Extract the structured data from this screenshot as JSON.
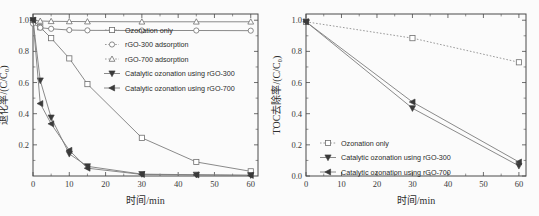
{
  "figure": {
    "panels": [
      "left",
      "right"
    ],
    "background": "#fbfbfb",
    "line_color": "#7d7d7d",
    "marker_fill_color": "#3a3a3a",
    "marker_open_color": "#ffffff"
  },
  "chart_data": [
    {
      "type": "line",
      "panel": "left",
      "title": "",
      "xlabel": "时间/min",
      "ylabel": "退化率/(C/C₀)",
      "xlim": [
        0,
        62
      ],
      "ylim": [
        0,
        1.04
      ],
      "xticks": [
        0,
        10,
        20,
        30,
        40,
        50,
        60
      ],
      "yticks": [
        0.2,
        0.4,
        0.6,
        0.8,
        1.0
      ],
      "grid": false,
      "legend_position": "upper-center",
      "series": [
        {
          "name": "Ozonation only",
          "marker": "open-square",
          "linestyle": "solid",
          "x": [
            0,
            2,
            5,
            10,
            15,
            30,
            45,
            60
          ],
          "values": [
            1.0,
            0.955,
            0.885,
            0.755,
            0.59,
            0.245,
            0.09,
            0.03
          ]
        },
        {
          "name": "rGO-300 adsorption",
          "marker": "open-circle",
          "linestyle": "solid",
          "x": [
            0,
            2,
            5,
            10,
            15,
            30,
            45,
            60
          ],
          "values": [
            0.978,
            0.952,
            0.945,
            0.937,
            0.935,
            0.934,
            0.934,
            0.933
          ]
        },
        {
          "name": "rGO-700 adsorption",
          "marker": "open-triangle-up",
          "linestyle": "solid",
          "x": [
            0,
            2,
            5,
            10,
            15,
            30,
            45,
            60
          ],
          "values": [
            1.0,
            0.995,
            0.993,
            0.992,
            0.991,
            0.99,
            0.99,
            0.99
          ]
        },
        {
          "name": "Catalytic ozonation using rGO-300",
          "marker": "filled-triangle-down",
          "linestyle": "solid",
          "x": [
            0,
            2,
            5,
            10,
            15,
            30,
            45,
            60
          ],
          "values": [
            1.0,
            0.613,
            0.375,
            0.142,
            0.062,
            0.012,
            0.008,
            0.005
          ]
        },
        {
          "name": "Catalytic ozonation using rGO-700",
          "marker": "filled-triangle-left",
          "linestyle": "solid",
          "x": [
            0,
            2,
            5,
            10,
            15,
            30,
            45,
            60
          ],
          "values": [
            1.0,
            0.465,
            0.335,
            0.165,
            0.05,
            0.01,
            0.007,
            0.004
          ]
        }
      ]
    },
    {
      "type": "line",
      "panel": "right",
      "title": "",
      "xlabel": "时间/min",
      "ylabel": "TOC去除率/(C/C₀)",
      "xlim": [
        0,
        62
      ],
      "ylim": [
        0,
        1.04
      ],
      "xticks": [
        0,
        10,
        20,
        30,
        40,
        50,
        60
      ],
      "yticks": [
        0.0,
        0.2,
        0.4,
        0.6,
        0.8,
        1.0
      ],
      "grid": false,
      "legend_position": "lower-left",
      "series": [
        {
          "name": "Ozonation only",
          "marker": "open-square",
          "linestyle": "dotted",
          "x": [
            0,
            30,
            60
          ],
          "values": [
            0.99,
            0.885,
            0.73
          ]
        },
        {
          "name": "Catalytic ozonation using rGO-300",
          "marker": "filled-triangle-down",
          "linestyle": "solid",
          "x": [
            0,
            30,
            60
          ],
          "values": [
            0.99,
            0.435,
            0.065
          ]
        },
        {
          "name": "Catalytic ozonation using rGO-700",
          "marker": "filled-triangle-left",
          "linestyle": "solid",
          "x": [
            0,
            30,
            60
          ],
          "values": [
            0.99,
            0.475,
            0.09
          ]
        }
      ]
    }
  ]
}
